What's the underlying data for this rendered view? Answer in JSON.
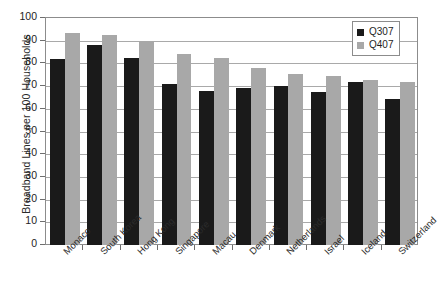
{
  "chart_data": {
    "type": "bar",
    "title": "",
    "subtitle": "",
    "xlabel": "",
    "ylabel": "Broadband Lines per 100 Households",
    "ylim": [
      0,
      100
    ],
    "ytick_step": 10,
    "yticks": [
      "100",
      "90",
      "80",
      "70",
      "60",
      "50",
      "40",
      "30",
      "20",
      "10",
      "0"
    ],
    "grid": true,
    "legend_position": "top-right",
    "categories": [
      "Monaco",
      "South Korea",
      "Hong Kong",
      "Singapore",
      "Macau",
      "Denmark",
      "Netherlands",
      "Israel",
      "Iceland",
      "Switzerland"
    ],
    "series": [
      {
        "name": "Q307",
        "color": "#1a1a1a",
        "values": [
          81.8,
          88.0,
          82.5,
          71.0,
          68.0,
          69.0,
          70.0,
          67.5,
          72.0,
          64.5
        ]
      },
      {
        "name": "Q407",
        "color": "#a8a8a8",
        "values": [
          93.5,
          92.5,
          90.0,
          84.0,
          82.5,
          78.0,
          75.5,
          74.5,
          72.5,
          72.0
        ]
      }
    ]
  },
  "legend": {
    "items": [
      {
        "label": "Q307",
        "color": "#1a1a1a"
      },
      {
        "label": "Q407",
        "color": "#a8a8a8"
      }
    ]
  }
}
